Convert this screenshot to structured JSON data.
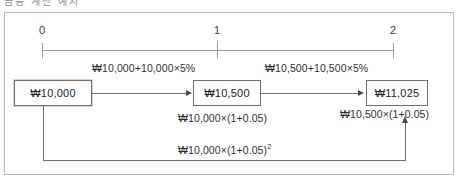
{
  "figure": {
    "top_cut_text": "금융 계산 예시",
    "timeline": {
      "ticks": [
        {
          "label": "0",
          "period": 0
        },
        {
          "label": "1",
          "period": 1
        },
        {
          "label": "2",
          "period": 2
        }
      ]
    },
    "boxes": [
      {
        "id": "box-period-0",
        "value": "₩10,000"
      },
      {
        "id": "box-period-1",
        "value": "₩10,500"
      },
      {
        "id": "box-period-2",
        "value": "₩11,025"
      }
    ],
    "captions": {
      "top_left": "₩10,000+10,000×5%",
      "top_right": "₩10,500+10,500×5%",
      "mid_left": "₩10,000×(1+0.05)",
      "mid_right": "₩10,500×(1+0.05)",
      "bottom_base": "₩10,000×(1+0.05)",
      "bottom_exponent": "2"
    }
  },
  "chart_data": {
    "type": "diagram",
    "x": [
      0,
      1,
      2
    ],
    "xlabel": "Period",
    "values": [
      10000,
      10500,
      11025
    ],
    "currency": "₩",
    "interest_rate": 0.05,
    "annotations": [
      "₩10,000+10,000×5%",
      "₩10,500+10,500×5%",
      "₩10,000×(1+0.05)",
      "₩10,500×(1+0.05)",
      "₩10,000×(1+0.05)²"
    ]
  }
}
